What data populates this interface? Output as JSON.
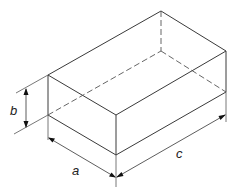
{
  "diagram": {
    "type": "isometric-rectangular-box",
    "labels": {
      "height": "b",
      "depth": "a",
      "length": "c"
    },
    "colors": {
      "line": "#3a3a3a",
      "background": "#ffffff"
    }
  }
}
